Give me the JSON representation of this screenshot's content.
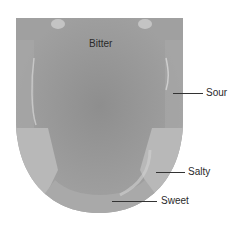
{
  "diagram": {
    "regions": [
      {
        "id": "bitter",
        "label": "Bitter",
        "area": "back of tongue"
      },
      {
        "id": "sour",
        "label": "Sour",
        "area": "sides, middle"
      },
      {
        "id": "salty",
        "label": "Salty",
        "area": "sides, front"
      },
      {
        "id": "sweet",
        "label": "Sweet",
        "area": "tip"
      }
    ],
    "colors": {
      "tongue_base": "#9a9a9a",
      "tongue_center": "#8c8c8c",
      "edge_zone": "#b4b4b4",
      "highlight": "#d2d2d2",
      "leader_line": "#333333",
      "label_text": "#2a2a2a",
      "background": "#ffffff"
    }
  }
}
